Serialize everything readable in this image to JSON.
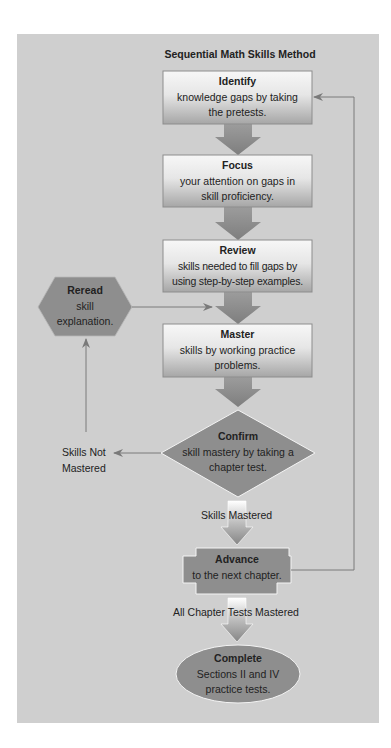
{
  "diagram": {
    "title": "Sequential Math Skills Method",
    "nodes": {
      "identify": {
        "title": "Identify",
        "text": "knowledge gaps by taking the pretests."
      },
      "focus": {
        "title": "Focus",
        "text": "your attention on gaps in skill proficiency."
      },
      "review": {
        "title": "Review",
        "text": "skills needed to fill gaps by using step-by-step examples."
      },
      "reread": {
        "title": "Reread",
        "text": "skill explanation."
      },
      "master": {
        "title": "Master",
        "text": "skills by working practice problems."
      },
      "confirm": {
        "title": "Confirm",
        "text": "skill mastery by taking a chapter test."
      },
      "advance": {
        "title": "Advance",
        "text": "to the next chapter."
      },
      "complete": {
        "title": "Complete",
        "text": "Sections II and IV practice tests."
      }
    },
    "edge_labels": {
      "not_mastered": "Skills Not Mastered",
      "mastered": "Skills Mastered",
      "all_mastered": "All Chapter Tests Mastered"
    },
    "colors": {
      "panel": "#cfcfcf",
      "box_top": "#f6f6f6",
      "box_bottom": "#a9a9a9",
      "shape_dark": "#8e8e8e",
      "arrow": "#8a8a8a",
      "line": "#7a7a7a"
    }
  }
}
